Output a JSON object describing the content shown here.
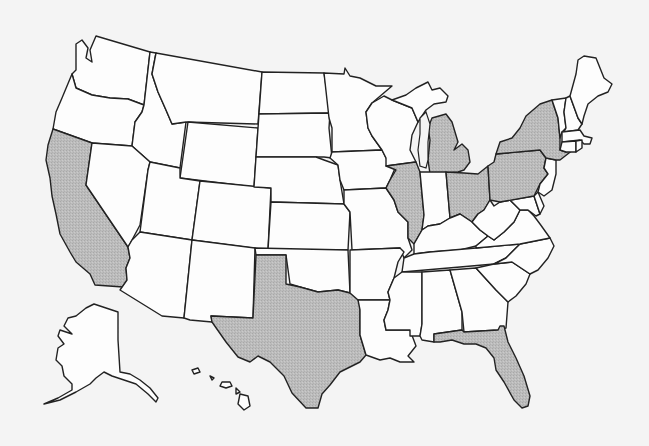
{
  "map": {
    "title": "United States map with highlighted states",
    "colors": {
      "background": "#f4f4f4",
      "state_fill": "#fdfdfd",
      "highlight_fill": "#b8b8b8",
      "border": "#222222"
    },
    "highlighted_states": [
      "California",
      "Texas",
      "Illinois",
      "Michigan",
      "Ohio",
      "Pennsylvania",
      "New York",
      "Florida"
    ],
    "states": [
      {
        "id": "WA",
        "name": "Washington",
        "highlighted": false
      },
      {
        "id": "OR",
        "name": "Oregon",
        "highlighted": false
      },
      {
        "id": "CA",
        "name": "California",
        "highlighted": true
      },
      {
        "id": "ID",
        "name": "Idaho",
        "highlighted": false
      },
      {
        "id": "NV",
        "name": "Nevada",
        "highlighted": false
      },
      {
        "id": "MT",
        "name": "Montana",
        "highlighted": false
      },
      {
        "id": "WY",
        "name": "Wyoming",
        "highlighted": false
      },
      {
        "id": "UT",
        "name": "Utah",
        "highlighted": false
      },
      {
        "id": "AZ",
        "name": "Arizona",
        "highlighted": false
      },
      {
        "id": "CO",
        "name": "Colorado",
        "highlighted": false
      },
      {
        "id": "NM",
        "name": "New Mexico",
        "highlighted": false
      },
      {
        "id": "ND",
        "name": "North Dakota",
        "highlighted": false
      },
      {
        "id": "SD",
        "name": "South Dakota",
        "highlighted": false
      },
      {
        "id": "NE",
        "name": "Nebraska",
        "highlighted": false
      },
      {
        "id": "KS",
        "name": "Kansas",
        "highlighted": false
      },
      {
        "id": "OK",
        "name": "Oklahoma",
        "highlighted": false
      },
      {
        "id": "TX",
        "name": "Texas",
        "highlighted": true
      },
      {
        "id": "MN",
        "name": "Minnesota",
        "highlighted": false
      },
      {
        "id": "IA",
        "name": "Iowa",
        "highlighted": false
      },
      {
        "id": "MO",
        "name": "Missouri",
        "highlighted": false
      },
      {
        "id": "AR",
        "name": "Arkansas",
        "highlighted": false
      },
      {
        "id": "LA",
        "name": "Louisiana",
        "highlighted": false
      },
      {
        "id": "WI",
        "name": "Wisconsin",
        "highlighted": false
      },
      {
        "id": "IL",
        "name": "Illinois",
        "highlighted": true
      },
      {
        "id": "MI",
        "name": "Michigan",
        "highlighted": true
      },
      {
        "id": "IN",
        "name": "Indiana",
        "highlighted": false
      },
      {
        "id": "OH",
        "name": "Ohio",
        "highlighted": true
      },
      {
        "id": "KY",
        "name": "Kentucky",
        "highlighted": false
      },
      {
        "id": "TN",
        "name": "Tennessee",
        "highlighted": false
      },
      {
        "id": "MS",
        "name": "Mississippi",
        "highlighted": false
      },
      {
        "id": "AL",
        "name": "Alabama",
        "highlighted": false
      },
      {
        "id": "GA",
        "name": "Georgia",
        "highlighted": false
      },
      {
        "id": "FL",
        "name": "Florida",
        "highlighted": true
      },
      {
        "id": "SC",
        "name": "South Carolina",
        "highlighted": false
      },
      {
        "id": "NC",
        "name": "North Carolina",
        "highlighted": false
      },
      {
        "id": "VA",
        "name": "Virginia",
        "highlighted": false
      },
      {
        "id": "WV",
        "name": "West Virginia",
        "highlighted": false
      },
      {
        "id": "MD",
        "name": "Maryland",
        "highlighted": false
      },
      {
        "id": "DE",
        "name": "Delaware",
        "highlighted": false
      },
      {
        "id": "PA",
        "name": "Pennsylvania",
        "highlighted": true
      },
      {
        "id": "NJ",
        "name": "New Jersey",
        "highlighted": false
      },
      {
        "id": "NY",
        "name": "New York",
        "highlighted": true
      },
      {
        "id": "CT",
        "name": "Connecticut",
        "highlighted": false
      },
      {
        "id": "RI",
        "name": "Rhode Island",
        "highlighted": false
      },
      {
        "id": "MA",
        "name": "Massachusetts",
        "highlighted": false
      },
      {
        "id": "VT",
        "name": "Vermont",
        "highlighted": false
      },
      {
        "id": "NH",
        "name": "New Hampshire",
        "highlighted": false
      },
      {
        "id": "ME",
        "name": "Maine",
        "highlighted": false
      },
      {
        "id": "AK",
        "name": "Alaska",
        "highlighted": false
      },
      {
        "id": "HI",
        "name": "Hawaii",
        "highlighted": false
      }
    ]
  }
}
